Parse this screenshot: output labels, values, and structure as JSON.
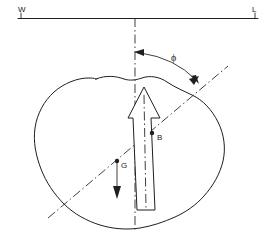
{
  "figure": {
    "background_color": "#ffffff",
    "line_color": "#1f1f1f",
    "width": 268,
    "height": 245
  },
  "labels": {
    "water_surface_left": "W",
    "water_surface_right": "L",
    "angle_symbol": "ϕ",
    "point_buoyancy": "B",
    "point_gravity": "G"
  },
  "annotations": {
    "horizontal_line_name": "water-line",
    "vertical_reference_name": "vertical-reference-axis",
    "inclined_axis_name": "inclined-body-axis",
    "angle_arc_name": "heel-angle-arc",
    "body_outline_name": "body-cross-section-outline",
    "buoyancy_arrow_name": "buoyancy-force-arrow",
    "gravity_arrow_name": "gravity-force-arrow"
  },
  "geometry": {
    "horizontal_line_y": 18,
    "horizontal_line_x1": 18,
    "horizontal_line_x2": 258,
    "vertical_axis_x": 135,
    "vertical_axis_y1": 18,
    "vertical_axis_y2": 232,
    "inclined_axis_angle_deg": 32,
    "buoyancy_point": [
      153,
      133
    ],
    "gravity_point": [
      117,
      163
    ]
  }
}
